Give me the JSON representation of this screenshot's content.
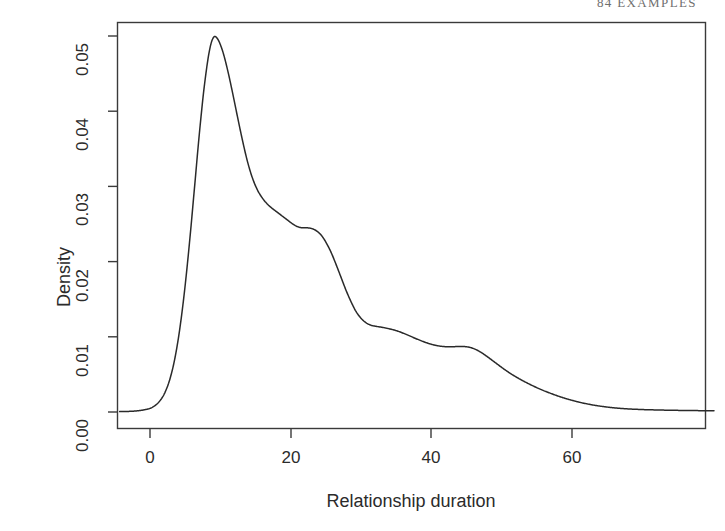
{
  "page": {
    "header_number": "84",
    "header_title": "EXAMPLES"
  },
  "figure": {
    "ylabel": "Density",
    "xlabel": "Relationship duration",
    "y_ticks": [
      "0.00",
      "0.01",
      "0.02",
      "0.03",
      "0.04",
      "0.05"
    ],
    "x_ticks": [
      "0",
      "20",
      "40",
      "60"
    ],
    "line_color": "#2a2a2a",
    "axis_color": "#3a3a3a",
    "background": "#ffffff"
  },
  "chart_data": {
    "type": "line",
    "title": "",
    "subtitle": "",
    "xlabel": "Relationship duration",
    "ylabel": "Density",
    "xlim": [
      -4.3,
      80.0
    ],
    "ylim": [
      -0.0015,
      0.0525
    ],
    "x_ticks": [
      0,
      20,
      40,
      60
    ],
    "y_ticks": [
      0.0,
      0.01,
      0.02,
      0.03,
      0.04,
      0.05
    ],
    "grid": false,
    "legend": "none",
    "annotations": [
      "kernel density estimate of relationship duration",
      "primary mode near duration 9 at density 0.0498",
      "shoulder near duration 22 at density 0.0245",
      "shoulder near duration 31 at density 0.0115",
      "minor bump near duration 43 at density 0.0088",
      "right tail decays to ~0 beyond duration 66"
    ],
    "series": [
      {
        "name": "Density",
        "x": [
          -4.3,
          -3.0,
          -2.0,
          -1.0,
          0.0,
          0.7,
          1.4,
          2.1,
          2.8,
          3.5,
          4.2,
          4.9,
          5.6,
          6.3,
          7.0,
          7.7,
          8.4,
          9.0,
          9.6,
          10.3,
          11.0,
          11.7,
          12.4,
          13.1,
          13.8,
          14.5,
          15.2,
          15.9,
          16.6,
          17.3,
          18.0,
          18.7,
          19.4,
          20.1,
          20.8,
          21.5,
          22.2,
          22.9,
          23.6,
          24.3,
          25.0,
          25.7,
          26.4,
          27.1,
          27.8,
          28.5,
          29.2,
          29.9,
          30.6,
          31.3,
          32.0,
          33.0,
          34.0,
          35.0,
          36.0,
          37.0,
          38.0,
          39.0,
          40.0,
          41.0,
          42.0,
          43.0,
          44.0,
          45.0,
          46.0,
          47.0,
          48.0,
          49.0,
          50.0,
          51.0,
          52.0,
          53.0,
          54.0,
          55.0,
          56.0,
          57.0,
          58.0,
          59.0,
          60.0,
          61.0,
          62.0,
          63.0,
          64.0,
          65.0,
          66.0,
          67.0,
          68.0,
          70.0,
          72.0,
          74.0,
          76.0,
          78.0,
          80.0
        ],
        "y": [
          5e-05,
          8e-05,
          0.00014,
          0.00026,
          0.00048,
          0.00085,
          0.00148,
          0.00255,
          0.0043,
          0.007,
          0.0109,
          0.0161,
          0.0225,
          0.0297,
          0.037,
          0.0433,
          0.0479,
          0.0498,
          0.0496,
          0.048,
          0.0455,
          0.0425,
          0.0393,
          0.0362,
          0.0334,
          0.0312,
          0.0296,
          0.0285,
          0.0277,
          0.0271,
          0.0266,
          0.0261,
          0.0256,
          0.0251,
          0.0247,
          0.0245,
          0.0245,
          0.0244,
          0.0241,
          0.0235,
          0.0225,
          0.0212,
          0.0196,
          0.0179,
          0.0162,
          0.0147,
          0.0134,
          0.0125,
          0.0119,
          0.01155,
          0.0114,
          0.01125,
          0.01105,
          0.0108,
          0.01045,
          0.01005,
          0.00965,
          0.00928,
          0.00898,
          0.00878,
          0.00868,
          0.00868,
          0.00872,
          0.00866,
          0.0084,
          0.0079,
          0.00725,
          0.00655,
          0.00585,
          0.0052,
          0.00462,
          0.0041,
          0.00362,
          0.00318,
          0.00278,
          0.00242,
          0.00208,
          0.00178,
          0.00152,
          0.00128,
          0.00108,
          0.0009,
          0.00076,
          0.00064,
          0.00054,
          0.00046,
          0.0004,
          0.00032,
          0.00027,
          0.00023,
          0.0002,
          0.00018,
          0.00016
        ]
      }
    ]
  }
}
